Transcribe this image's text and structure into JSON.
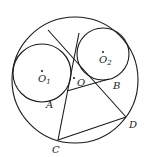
{
  "diagram": {
    "title": "",
    "circles": [
      {
        "name": "O",
        "cx": 75,
        "cy": 80,
        "r": 63
      },
      {
        "name": "O1",
        "cx": 42,
        "cy": 73,
        "r": 29
      },
      {
        "name": "O2",
        "cx": 103,
        "cy": 54,
        "r": 26
      }
    ],
    "points": {
      "A": {
        "label": "A",
        "x": 67,
        "y": 91
      },
      "B": {
        "label": "B",
        "x": 109,
        "y": 79
      },
      "C": {
        "label": "C",
        "x": 58,
        "y": 140
      },
      "D": {
        "label": "D",
        "x": 126,
        "y": 117
      }
    },
    "labels": {
      "O": "O",
      "O1_main": "O",
      "O1_sub": "1",
      "O2_main": "O",
      "O2_sub": "2",
      "A": "A",
      "B": "B",
      "C": "C",
      "D": "D"
    },
    "segments": [
      {
        "from": [
          48,
          30
        ],
        "to": [
          126,
          117
        ]
      },
      {
        "from": [
          79,
          33
        ],
        "to": [
          58,
          140
        ]
      },
      {
        "from": [
          67,
          91
        ],
        "to": [
          109,
          79
        ]
      },
      {
        "from": [
          58,
          140
        ],
        "to": [
          126,
          117
        ]
      }
    ],
    "colors": {
      "stroke": "#1a1a1a",
      "background": "#ffffff"
    }
  }
}
